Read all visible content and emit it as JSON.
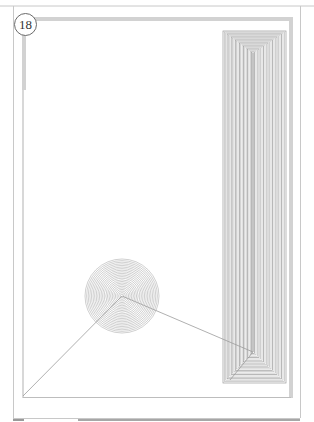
{
  "page": {
    "number": "18",
    "background": "#ffffff"
  },
  "frame": {
    "outer_color": "#c8c8c8",
    "band_color": "#cfcfcf",
    "inner_line_color": "#bdbdbd"
  },
  "artwork": {
    "description": "Abstract geometric line drawing",
    "nested_rectangle": {
      "x": 223,
      "y": 31,
      "width": 63,
      "height": 352,
      "convergence_point": [
        253,
        352
      ],
      "line_color": "#9a9a9a"
    },
    "concentric_disc": {
      "center": [
        122,
        296
      ],
      "radius": 37,
      "line_color": "#a8a8a8"
    },
    "connector_lines": [
      {
        "from": [
          122,
          296
        ],
        "to": [
          23,
          396
        ]
      },
      {
        "from": [
          122,
          296
        ],
        "to": [
          253,
          352
        ]
      },
      {
        "from": [
          230,
          380
        ],
        "to": [
          253,
          352
        ]
      }
    ]
  }
}
